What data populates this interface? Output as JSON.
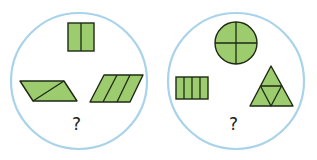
{
  "colors": {
    "circle_stroke": "#a9d3ea",
    "shape_fill": "#9ccc6e",
    "shape_stroke": "#1e2a14",
    "text": "#222222"
  },
  "groups": [
    {
      "name": "left-group",
      "shapes": [
        {
          "type": "square",
          "parts": 2,
          "description": "square split into 2 halves"
        },
        {
          "type": "parallelogram",
          "parts": 2,
          "description": "parallelogram split by diagonal into 2 parts"
        },
        {
          "type": "parallelogram",
          "parts": 3,
          "description": "parallelogram split into 3 parts"
        }
      ],
      "question": "?"
    },
    {
      "name": "right-group",
      "shapes": [
        {
          "type": "circle",
          "parts": 4,
          "description": "circle split into 4 quarters"
        },
        {
          "type": "rectangle",
          "parts": 4,
          "description": "rectangle split into 4 vertical strips"
        },
        {
          "type": "triangle",
          "parts": 4,
          "description": "triangle split into 4 smaller triangles"
        }
      ],
      "question": "?"
    }
  ]
}
